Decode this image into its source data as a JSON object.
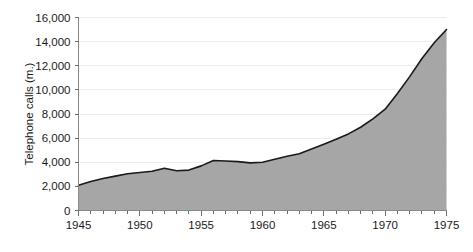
{
  "chart_data": {
    "type": "area",
    "title": "",
    "subtitle": "",
    "xlabel": "",
    "ylabel": "Telephone calls (m.)",
    "xlim": [
      1945,
      1975
    ],
    "ylim": [
      0,
      16000
    ],
    "grid": true,
    "legend": false,
    "legend_position": "none",
    "y_ticks": [
      0,
      2000,
      4000,
      6000,
      8000,
      10000,
      12000,
      14000,
      16000
    ],
    "y_tick_labels": [
      "0",
      "2,000",
      "4,000",
      "6,000",
      "8,000",
      "10,000",
      "12,000",
      "14,000",
      "16,000"
    ],
    "x_ticks": [
      1945,
      1950,
      1955,
      1960,
      1965,
      1970,
      1975
    ],
    "x_tick_labels": [
      "1945",
      "1950",
      "1955",
      "1960",
      "1965",
      "1970",
      "1975"
    ],
    "x_minor_tick_step": 1,
    "colors": {
      "area_fill": "#a6a6a6",
      "line": "#1a1a1a",
      "gridline": "#ededed",
      "axis": "#8a8a8a",
      "background": "#ffffff",
      "text": "#1a1a1a"
    },
    "x": [
      1945,
      1946,
      1947,
      1948,
      1949,
      1950,
      1951,
      1952,
      1953,
      1954,
      1955,
      1956,
      1957,
      1958,
      1959,
      1960,
      1961,
      1962,
      1963,
      1964,
      1965,
      1966,
      1967,
      1968,
      1969,
      1970,
      1971,
      1972,
      1973,
      1974,
      1975
    ],
    "values": [
      2100,
      2400,
      2650,
      2850,
      3050,
      3150,
      3250,
      3500,
      3300,
      3350,
      3700,
      4150,
      4100,
      4050,
      3950,
      4000,
      4250,
      4500,
      4700,
      5100,
      5500,
      5900,
      6350,
      6900,
      7600,
      8400,
      9700,
      11100,
      12600,
      13900,
      15000
    ],
    "series": [
      {
        "name": "Telephone calls (m.)",
        "values": [
          2100,
          2400,
          2650,
          2850,
          3050,
          3150,
          3250,
          3500,
          3300,
          3350,
          3700,
          4150,
          4100,
          4050,
          3950,
          4000,
          4250,
          4500,
          4700,
          5100,
          5500,
          5900,
          6350,
          6900,
          7600,
          8400,
          9700,
          11100,
          12600,
          13900,
          15000
        ]
      }
    ]
  }
}
